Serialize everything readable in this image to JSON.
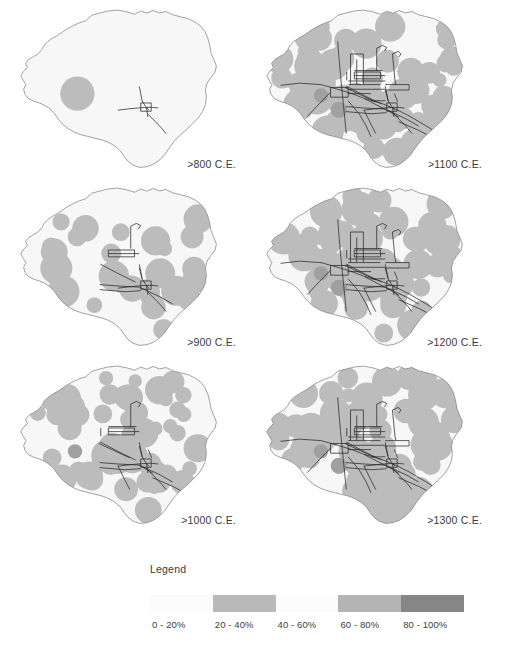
{
  "figure": {
    "background_color": "#ffffff"
  },
  "panels": [
    {
      "id": "panel-800",
      "label": ">800 C.E.",
      "period": "800",
      "col": 0,
      "row": 0,
      "density_level": 1,
      "settlement_count": 1,
      "blob_seed": 11
    },
    {
      "id": "panel-1100",
      "label": ">1100 C.E.",
      "period": "1100",
      "col": 1,
      "row": 0,
      "density_level": 4,
      "settlement_count": 58,
      "blob_seed": 44
    },
    {
      "id": "panel-900",
      "label": ">900 C.E.",
      "period": "900",
      "col": 0,
      "row": 1,
      "density_level": 2,
      "settlement_count": 26,
      "blob_seed": 22
    },
    {
      "id": "panel-1200",
      "label": ">1200 C.E.",
      "period": "1200",
      "col": 1,
      "row": 1,
      "density_level": 4,
      "settlement_count": 62,
      "blob_seed": 55
    },
    {
      "id": "panel-1000",
      "label": ">1000 C.E.",
      "period": "1000",
      "col": 0,
      "row": 2,
      "density_level": 3,
      "settlement_count": 44,
      "blob_seed": 33
    },
    {
      "id": "panel-1300",
      "label": ">1300 C.E.",
      "period": "1300",
      "col": 1,
      "row": 2,
      "density_level": 4,
      "settlement_count": 60,
      "blob_seed": 66
    }
  ],
  "legend": {
    "title": "Legend",
    "classes": [
      {
        "label": "0 - 20%",
        "color": "#fbfbfb"
      },
      {
        "label": "20 - 40%",
        "color": "#b9b9b9"
      },
      {
        "label": "40 - 60%",
        "color": "#fcfcfc"
      },
      {
        "label": "60 - 80%",
        "color": "#b4b4b4"
      },
      {
        "label": "80 - 100%",
        "color": "#868686"
      }
    ]
  },
  "map_style": {
    "outline_color": "#8a8a8a",
    "interior_fill": "#f7f7f7",
    "blob_fill": "#bcbcbc",
    "blob_fill_dark": "#a0a0a0",
    "network_color": "#2a2a2a"
  },
  "chart_data": {
    "type": "map",
    "subtitle": "Proportion of area occupied, grayscale classes",
    "periods": [
      ">800 C.E.",
      ">900 C.E.",
      ">1000 C.E.",
      ">1100 C.E.",
      ">1200 C.E.",
      ">1300 C.E."
    ],
    "legend_classes": [
      "0 - 20%",
      "20 - 40%",
      "40 - 60%",
      "60 - 80%",
      "80 - 100%"
    ],
    "legend_colors": [
      "#fbfbfb",
      "#b9b9b9",
      "#fcfcfc",
      "#b4b4b4",
      "#868686"
    ],
    "approx_occupied_fraction": [
      0.03,
      0.22,
      0.48,
      0.62,
      0.58,
      0.5
    ],
    "grid": false,
    "legend_position": "bottom"
  }
}
